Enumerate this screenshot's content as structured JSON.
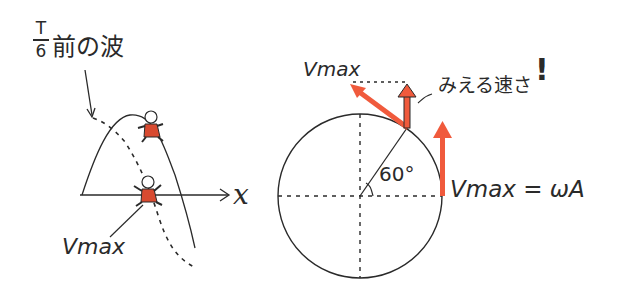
{
  "left_panel": {
    "caption_fraction_num": "T",
    "caption_fraction_den": "6",
    "caption_text": "前の波",
    "axis_label": "x",
    "vmax_label": "Vmax"
  },
  "right_panel": {
    "vmax_top_label": "Vmax",
    "visible_speed_label": "みえる速さ",
    "exclamation": "!",
    "angle_label": "60°",
    "equation": "Vmax = ωA"
  },
  "colors": {
    "ink": "#2a2a2a",
    "arrow_red": "#f05a3c",
    "figure_red": "#d84a30"
  }
}
